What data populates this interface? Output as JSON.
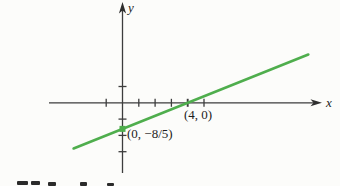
{
  "figure": {
    "y_axis_label": "y",
    "x_axis_label": "x",
    "x_intercept_label": "(4, 0)",
    "y_intercept_label": "(0, −8/5)"
  },
  "colors": {
    "line_green": "#4fae4d",
    "axis_gray": "#3d3d3d",
    "text_black": "#1c1c1c"
  },
  "chart_data": {
    "type": "line",
    "title": "",
    "xlabel": "x",
    "ylabel": "y",
    "grid": false,
    "legend": false,
    "equation": "y = (2/5)x - 8/5",
    "slope": 0.4,
    "x_intercept": [
      4,
      0
    ],
    "y_intercept": [
      0,
      -1.6
    ],
    "line_segment": {
      "x_start": -3.0,
      "y_start": -2.8,
      "x_end": 11.4,
      "y_end": 2.96
    },
    "x_ticks": [
      -1,
      1,
      2,
      3,
      4,
      5
    ],
    "y_ticks": [
      1,
      -1,
      -2,
      -3
    ],
    "xlim": [
      -4.5,
      12.3
    ],
    "ylim": [
      -4.3,
      6.1
    ],
    "annotations": [
      {
        "text": "(4, 0)",
        "at": [
          4,
          0
        ],
        "placement": "below-right"
      },
      {
        "text": "(0, −8/5)",
        "at": [
          0,
          -1.6
        ],
        "placement": "right"
      }
    ],
    "layout": {
      "origin_px": [
        122.5,
        102.8
      ],
      "unit_px": 16.3,
      "tick_half_px": 4,
      "line_width_px": 2.6,
      "marker_size_px": 6
    }
  }
}
